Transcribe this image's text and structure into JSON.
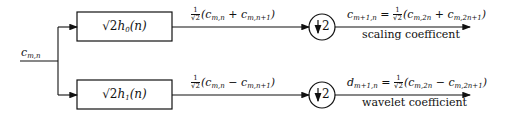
{
  "diagram": {
    "title": "",
    "input": {
      "label": "c",
      "sub": "m,n"
    },
    "branches": [
      {
        "filter": {
          "prefix": "√2",
          "name": "h",
          "sub": "0",
          "arg": "(n)"
        },
        "mid_expr": {
          "frac_num": "1",
          "frac_den": "√2",
          "expr_pre": "(c",
          "sub1": "m,n",
          "op": " + c",
          "sub2": "m,n+1",
          "expr_post": ")"
        },
        "downsample": {
          "symbol": "↓",
          "factor": "2"
        },
        "output_expr": {
          "lhs": "c",
          "lhs_sub": "m+1,n",
          "eq": " = ",
          "frac_num": "1",
          "frac_den": "√2",
          "expr_pre": "(c",
          "sub1": "m,2n",
          "op": " + c",
          "sub2": "m,2n+1",
          "expr_post": ")"
        },
        "caption": "scaling coefficent"
      },
      {
        "filter": {
          "prefix": "√2",
          "name": "h",
          "sub": "1",
          "arg": "(n)"
        },
        "mid_expr": {
          "frac_num": "1",
          "frac_den": "√2",
          "expr_pre": "(c",
          "sub1": "m,n",
          "op": " − c",
          "sub2": "m,n+1",
          "expr_post": ")"
        },
        "downsample": {
          "symbol": "↓",
          "factor": "2"
        },
        "output_expr": {
          "lhs": "d",
          "lhs_sub": "m+1,n",
          "eq": " = ",
          "frac_num": "1",
          "frac_den": "√2",
          "expr_pre": "(c",
          "sub1": "m,2n",
          "op": " − c",
          "sub2": "m,2n+1",
          "expr_post": ")"
        },
        "caption": "wavelet coefficient"
      }
    ],
    "colors": {
      "stroke": "#111111",
      "background": "#ffffff"
    }
  }
}
